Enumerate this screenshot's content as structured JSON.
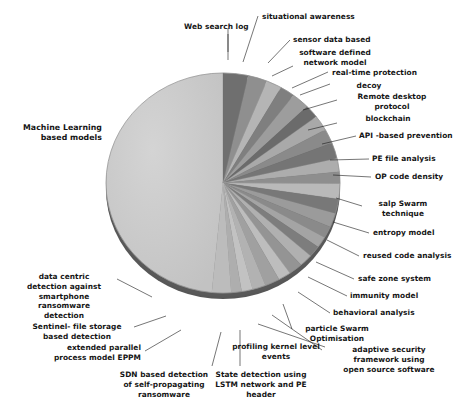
{
  "figure": {
    "type": "pie-chart-figure",
    "background": "#ffffff",
    "text_color": "#151515"
  },
  "chart_data": {
    "type": "pie",
    "title": "",
    "subtitle": "",
    "xlabel": "",
    "ylabel": "",
    "grid": false,
    "legend": "none",
    "label_style": "leader-line callouts outside pie",
    "start_angle_deg": 0,
    "direction": "clockwise",
    "pseudo_3d": true,
    "total_slices": 26,
    "categories": [
      "Machine Learning based models",
      "Web  search log",
      "situational awareness",
      "sensor data based",
      "software defined network model",
      "real-time protection",
      "decoy",
      "Remote desktop protocol",
      "blockchain",
      "API -based prevention",
      "PE  file analysis",
      "OP code  density",
      "salp Swarm technique",
      "entropy model",
      "reused code analysis",
      "safe zone system",
      "immunity model",
      "behavioral analysis",
      "particle Swarm Optimisation",
      "adaptive security framework using open source software",
      "profiling kernel level events",
      "State detection using LSTM  network and PE header",
      "SDN based detection of self-propagating ransomware",
      "extended parallel process model EPPM",
      "Sentinel-  file storage based  detection",
      "data centric detection against smartphone ransomware detection"
    ],
    "values": [
      47.5,
      3.4,
      2.6,
      2.1,
      2.0,
      2.4,
      1.9,
      2.2,
      2.1,
      2.3,
      1.9,
      1.7,
      2.2,
      2.1,
      2.0,
      1.7,
      1.6,
      1.6,
      1.8,
      1.9,
      1.7,
      2.0,
      1.8,
      1.5,
      1.4,
      2.6
    ],
    "colors": [
      "#c9c9c9",
      "#6f6f6f",
      "#8f8f8f",
      "#b5b5b5",
      "#7f7f7f",
      "#9d9d9d",
      "#6b6b6b",
      "#a9a9a9",
      "#8a8a8a",
      "#757575",
      "#adadad",
      "#8e8e8e",
      "#b9b9b9",
      "#787878",
      "#9b9b9b",
      "#8a8a8a",
      "#a4a4a4",
      "#7d7d7d",
      "#b0b0b0",
      "#949494",
      "#bdbdbd",
      "#a0a0a0",
      "#b2b2b2",
      "#c2c2c2",
      "#aeaeae",
      "#bcbcbc"
    ]
  },
  "labels": {
    "machine_learning": {
      "line1": "Machine Learning",
      "line2": "based models"
    },
    "web_search_log": {
      "line1": "Web  search log"
    },
    "situational_awareness": {
      "line1": "situational awareness"
    },
    "sensor_data_based": {
      "line1": "sensor data based"
    },
    "software_defined_network_model": {
      "line1": "software defined",
      "line2": "network model"
    },
    "real_time_protection": {
      "line1": "real-time protection"
    },
    "decoy": {
      "line1": "decoy"
    },
    "remote_desktop_protocol": {
      "line1": "Remote desktop",
      "line2": "protocol"
    },
    "blockchain": {
      "line1": "blockchain"
    },
    "api_based_prevention": {
      "line1": "API -based prevention"
    },
    "pe_file_analysis": {
      "line1": "PE  file analysis"
    },
    "op_code_density": {
      "line1": "OP code  density"
    },
    "salp_swarm_technique": {
      "line1": "salp Swarm",
      "line2": "technique"
    },
    "entropy_model": {
      "line1": "entropy model"
    },
    "reused_code_analysis": {
      "line1": "reused code analysis"
    },
    "safe_zone_system": {
      "line1": "safe zone system"
    },
    "immunity_model": {
      "line1": "immunity model"
    },
    "behavioral_analysis": {
      "line1": "behavioral analysis"
    },
    "particle_swarm_optimisation": {
      "line1": "particle Swarm",
      "line2": "Optimisation"
    },
    "adaptive_security_framework": {
      "line1": "adaptive security",
      "line2": "framework using",
      "line3": "open source software"
    },
    "profiling_kernel_level_events": {
      "line1": "profiling kernel level",
      "line2": "events"
    },
    "state_detection_lstm": {
      "line1": "State detection using",
      "line2": "LSTM  network and PE",
      "line3": "header"
    },
    "sdn_based_detection": {
      "line1": "SDN based detection",
      "line2": "of self-propagating",
      "line3": "ransomware"
    },
    "extended_parallel_process_model": {
      "line1": "extended parallel",
      "line2": "process model EPPM"
    },
    "sentinel_file_storage": {
      "line1": "Sentinel-  file storage",
      "line2": "based  detection"
    },
    "data_centric_detection": {
      "line1": "data centric",
      "line2": "detection against",
      "line3": "smartphone",
      "line4": "ransomware",
      "line5": "detection"
    }
  }
}
